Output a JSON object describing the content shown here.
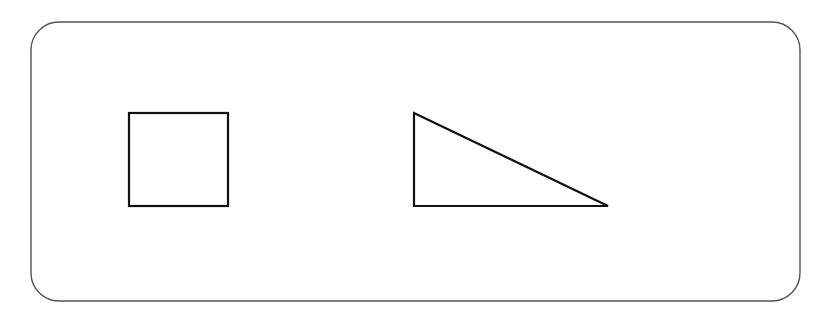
{
  "canvas": {
    "width": 828,
    "height": 319,
    "background_color": "#ffffff",
    "title": "Shapes Canvas"
  },
  "frame": {
    "name": "rounded-rectangle-frame",
    "x": 31,
    "y": 22,
    "width": 769,
    "height": 279,
    "corner_radius": 28,
    "stroke_color": "#555555",
    "stroke_width": 1.4,
    "fill": "none"
  },
  "shapes": [
    {
      "id": "square",
      "label": "Square",
      "type": "rect",
      "x": 129,
      "y": 113,
      "width": 99,
      "height": 93,
      "stroke_color": "#111111",
      "stroke_width": 2.2,
      "fill": "none"
    },
    {
      "id": "right-triangle",
      "label": "Right Triangle",
      "type": "polygon",
      "points": "414,113 414,206 608,206",
      "vertices": [
        {
          "x": 414,
          "y": 113
        },
        {
          "x": 414,
          "y": 206
        },
        {
          "x": 608,
          "y": 206
        }
      ],
      "right_angle_at": "bottom-left",
      "stroke_color": "#111111",
      "stroke_width": 2.2,
      "fill": "none"
    }
  ]
}
